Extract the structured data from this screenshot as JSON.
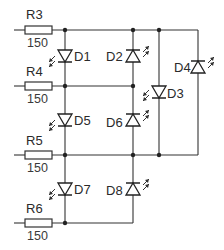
{
  "diagram": {
    "type": "charlieplexing-led-schematic",
    "colors": {
      "wire": "#333333",
      "background": "#ffffff"
    },
    "resistors": [
      {
        "id": "R3",
        "label": "R3",
        "value": "150"
      },
      {
        "id": "R4",
        "label": "R4",
        "value": "150"
      },
      {
        "id": "R5",
        "label": "R5",
        "value": "150"
      },
      {
        "id": "R6",
        "label": "R6",
        "value": "150"
      }
    ],
    "leds": [
      {
        "id": "D1",
        "label": "D1",
        "direction": "down"
      },
      {
        "id": "D2",
        "label": "D2",
        "direction": "up"
      },
      {
        "id": "D3",
        "label": "D3",
        "direction": "down"
      },
      {
        "id": "D4",
        "label": "D4",
        "direction": "up"
      },
      {
        "id": "D5",
        "label": "D5",
        "direction": "down"
      },
      {
        "id": "D6",
        "label": "D6",
        "direction": "up"
      },
      {
        "id": "D7",
        "label": "D7",
        "direction": "down"
      },
      {
        "id": "D8",
        "label": "D8",
        "direction": "up"
      }
    ]
  }
}
